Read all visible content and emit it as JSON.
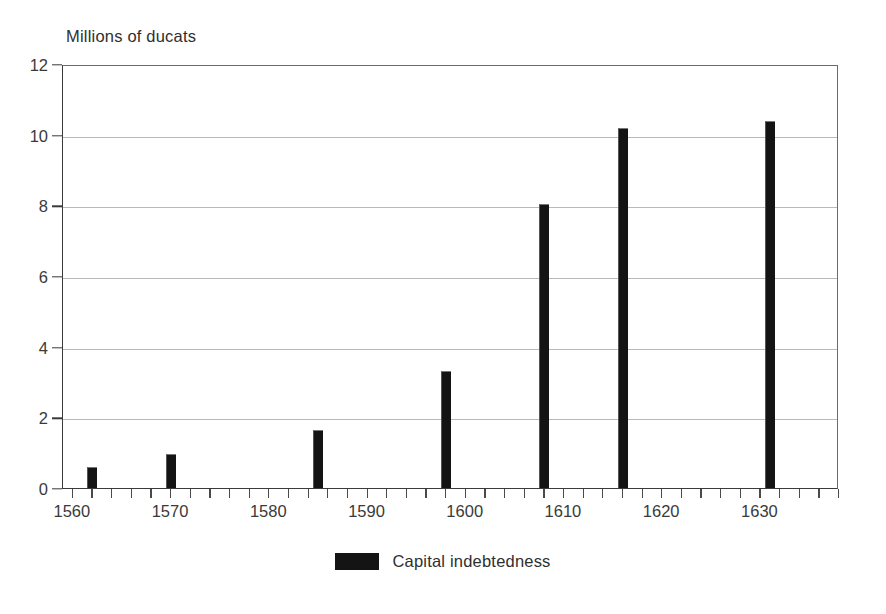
{
  "chart_data": {
    "type": "bar",
    "title": "",
    "ylabel": "Millions of ducats",
    "xlabel": "",
    "ylim": [
      0,
      12
    ],
    "xlim": [
      1559,
      1638
    ],
    "yticks": [
      0,
      2,
      4,
      6,
      8,
      10,
      12
    ],
    "ytick_labels": [
      "0",
      "2",
      "4",
      "6",
      "8",
      "10",
      "12"
    ],
    "xticks": [
      1560,
      1570,
      1580,
      1590,
      1600,
      1610,
      1620,
      1630
    ],
    "xtick_labels": [
      "1560",
      "1570",
      "1580",
      "1590",
      "1600",
      "1610",
      "1620",
      "1630"
    ],
    "x_minor_tick_interval": 2,
    "grid": "horizontal",
    "legend_position": "bottom-center",
    "bar_color": "#141414",
    "series": [
      {
        "name": "Capital indebtedness",
        "color": "#141414",
        "x": [
          1562,
          1570,
          1585,
          1598,
          1608,
          1616,
          1631
        ],
        "values": [
          0.6,
          0.95,
          1.65,
          3.3,
          8.05,
          10.2,
          10.4
        ]
      }
    ]
  },
  "axis_title": {
    "text": "Millions of ducats"
  },
  "legend": {
    "entries": [
      {
        "label": "Capital indebtedness",
        "color": "#141414"
      }
    ]
  }
}
